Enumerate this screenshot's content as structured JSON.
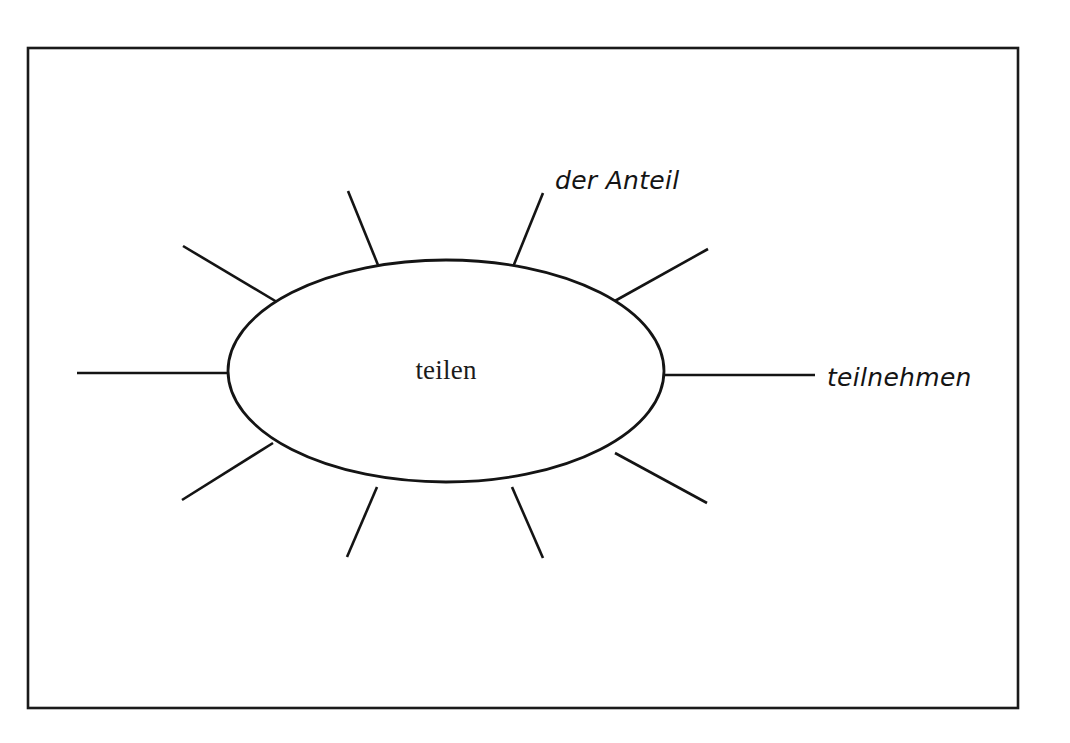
{
  "page": {
    "background_color": "#ffffff",
    "width": 1070,
    "height": 743
  },
  "frame": {
    "name": "worksheet-border",
    "color": "#1a1a1a",
    "x": 28,
    "y": 48,
    "width": 990,
    "height": 660
  },
  "diagram": {
    "type": "word-web",
    "center": {
      "label": "teilen",
      "cx": 446,
      "cy": 371,
      "rx": 218,
      "ry": 111,
      "stroke_color": "#141414",
      "fill_color": "#ffffff"
    },
    "spokes": [
      {
        "id": "spoke-1",
        "label": "",
        "x1": 378,
        "y1": 265,
        "x2": 348,
        "y2": 191,
        "angle_deg": 248
      },
      {
        "id": "spoke-2",
        "label": "der Anteil",
        "x1": 513,
        "y1": 267,
        "x2": 543,
        "y2": 193,
        "angle_deg": 292,
        "label_x": 555,
        "label_y": 189
      },
      {
        "id": "spoke-3",
        "label": "",
        "x1": 613,
        "y1": 302,
        "x2": 708,
        "y2": 249,
        "angle_deg": 331
      },
      {
        "id": "spoke-4",
        "label": "teilnehmen",
        "x1": 663,
        "y1": 375,
        "x2": 815,
        "y2": 375,
        "angle_deg": 0,
        "label_x": 827,
        "label_y": 386
      },
      {
        "id": "spoke-5",
        "label": "",
        "x1": 615,
        "y1": 453,
        "x2": 707,
        "y2": 503,
        "angle_deg": 29
      },
      {
        "id": "spoke-6",
        "label": "",
        "x1": 512,
        "y1": 487,
        "x2": 543,
        "y2": 558,
        "angle_deg": 67
      },
      {
        "id": "spoke-7",
        "label": "",
        "x1": 377,
        "y1": 487,
        "x2": 347,
        "y2": 557,
        "angle_deg": 113
      },
      {
        "id": "spoke-8",
        "label": "",
        "x1": 273,
        "y1": 443,
        "x2": 182,
        "y2": 500,
        "angle_deg": 148
      },
      {
        "id": "spoke-9",
        "label": "",
        "x1": 227,
        "y1": 373,
        "x2": 77,
        "y2": 373,
        "angle_deg": 180
      },
      {
        "id": "spoke-10",
        "label": "",
        "x1": 277,
        "y1": 302,
        "x2": 183,
        "y2": 246,
        "angle_deg": 211
      }
    ]
  }
}
